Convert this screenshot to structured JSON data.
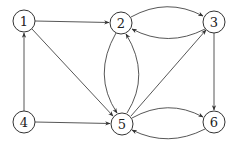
{
  "diagram": {
    "type": "directed-graph",
    "nodes": [
      {
        "id": "1",
        "label": "1",
        "x": 24,
        "y": 21
      },
      {
        "id": "2",
        "label": "2",
        "x": 121,
        "y": 23
      },
      {
        "id": "3",
        "label": "3",
        "x": 214,
        "y": 22
      },
      {
        "id": "4",
        "label": "4",
        "x": 24,
        "y": 122
      },
      {
        "id": "5",
        "label": "5",
        "x": 122,
        "y": 124
      },
      {
        "id": "6",
        "label": "6",
        "x": 214,
        "y": 122
      }
    ],
    "edges": [
      {
        "from": "1",
        "to": "2"
      },
      {
        "from": "1",
        "to": "5"
      },
      {
        "from": "4",
        "to": "1"
      },
      {
        "from": "4",
        "to": "5"
      },
      {
        "from": "2",
        "to": "3"
      },
      {
        "from": "3",
        "to": "2"
      },
      {
        "from": "3",
        "to": "6"
      },
      {
        "from": "5",
        "to": "3"
      },
      {
        "from": "5",
        "to": "6"
      },
      {
        "from": "6",
        "to": "5"
      },
      {
        "from": "2",
        "to": "5"
      },
      {
        "from": "5",
        "to": "2"
      }
    ],
    "colors": {
      "stroke": "#444444",
      "background": "#ffffff"
    }
  }
}
